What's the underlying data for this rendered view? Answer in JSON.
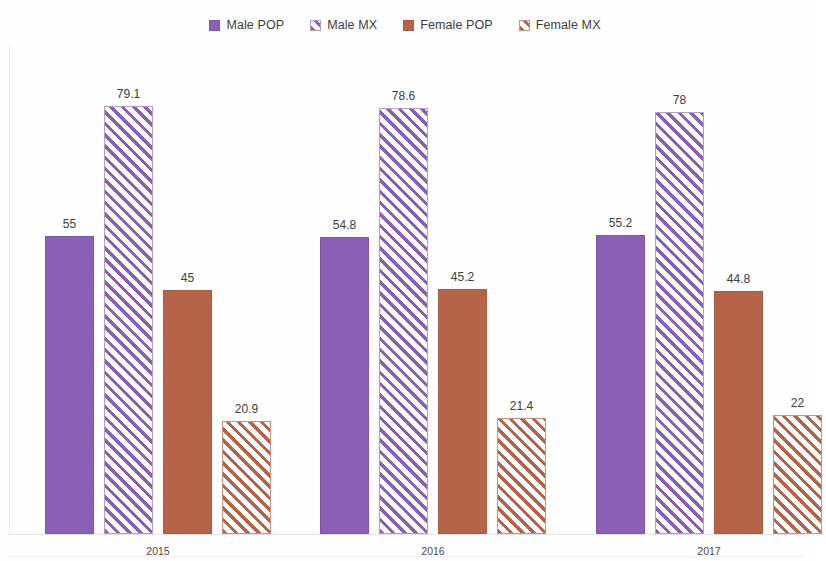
{
  "chart_data": {
    "type": "bar",
    "title": "",
    "subtitle": "",
    "xlabel": "",
    "ylabel": "",
    "grid": false,
    "legend_position": "top-center",
    "ylim": [
      0,
      85
    ],
    "categories": [
      "2015",
      "2016",
      "2017"
    ],
    "series": [
      {
        "name": "Male POP",
        "color": "#8b5fb5",
        "fill": "solid",
        "values": [
          55,
          54.8,
          55.2
        ],
        "labels": [
          "55",
          "54.8",
          "55.2"
        ]
      },
      {
        "name": "Male MX",
        "color": "#8b5fb5",
        "fill": "hatch",
        "values": [
          79.1,
          78.6,
          78
        ],
        "labels": [
          "79.1",
          "78.6",
          "78"
        ]
      },
      {
        "name": "Female POP",
        "color": "#b5644a",
        "fill": "solid",
        "values": [
          45,
          45.2,
          44.8
        ],
        "labels": [
          "45",
          "45.2",
          "44.8"
        ]
      },
      {
        "name": "Female MX",
        "color": "#b5644a",
        "fill": "hatch",
        "values": [
          20.9,
          21.4,
          22
        ],
        "labels": [
          "20.9",
          "21.4",
          "22"
        ]
      }
    ]
  },
  "legend": {
    "entries": [
      {
        "label": "Male POP",
        "swatch": "legend-swatch-male-pop"
      },
      {
        "label": "Male MX",
        "swatch": "legend-swatch-male-mx"
      },
      {
        "label": "Female POP",
        "swatch": "legend-swatch-female-pop"
      },
      {
        "label": "Female MX",
        "swatch": "legend-swatch-female-mx"
      }
    ]
  },
  "axis": {
    "x_tick_labels": [
      "2015",
      "2016",
      "2017"
    ]
  }
}
